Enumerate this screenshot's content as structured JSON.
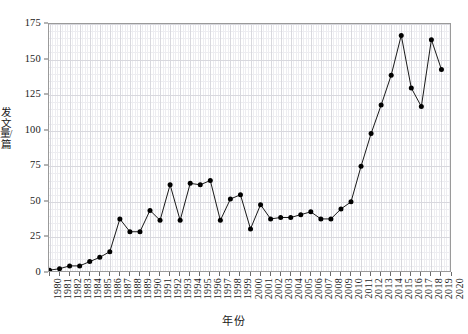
{
  "chart_data": {
    "type": "line",
    "title": "",
    "xlabel": "年份",
    "ylabel": "发文量/篇",
    "xlim": [
      1980,
      2020
    ],
    "ylim": [
      0,
      175
    ],
    "yticks": [
      0,
      25,
      50,
      75,
      100,
      125,
      150,
      175
    ],
    "ytick_labels": [
      "0",
      "25",
      "50",
      "75",
      "100",
      "125",
      "150",
      "175"
    ],
    "grid": true,
    "legend": "none",
    "marker": "filled-circle",
    "line_color": "#000000",
    "marker_color": "#000000",
    "categories": [
      "1980",
      "1981",
      "1982",
      "1983",
      "1984",
      "1985",
      "1986",
      "1987",
      "1988",
      "1989",
      "1990",
      "1991",
      "1992",
      "1993",
      "1994",
      "1995",
      "1996",
      "1997",
      "1998",
      "1999",
      "2000",
      "2001",
      "2002",
      "2003",
      "2004",
      "2005",
      "2006",
      "2007",
      "2008",
      "2009",
      "2010",
      "2011",
      "2012",
      "2013",
      "2014",
      "2015",
      "2016",
      "2017",
      "2018",
      "2019",
      "2020"
    ],
    "values": [
      2,
      3,
      5,
      5,
      8,
      11,
      15,
      38,
      29,
      29,
      44,
      37,
      62,
      37,
      63,
      62,
      65,
      37,
      52,
      55,
      31,
      48,
      38,
      39,
      39,
      41,
      43,
      38,
      38,
      45,
      50,
      75,
      98,
      118,
      139,
      167,
      130,
      117,
      164,
      143,
      null
    ]
  }
}
